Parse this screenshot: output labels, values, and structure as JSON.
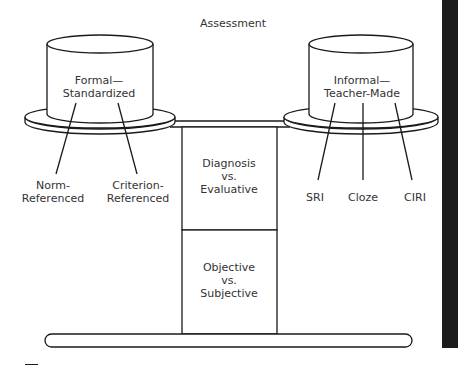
{
  "title": "Assessment",
  "left_pan": {
    "label_line1": "Formal—",
    "label_line2": "Standardized",
    "branches": [
      {
        "line1": "Norm-",
        "line2": "Referenced"
      },
      {
        "line1": "Criterion-",
        "line2": "Referenced"
      }
    ]
  },
  "right_pan": {
    "label_line1": "Informal—",
    "label_line2": "Teacher-Made",
    "branches": [
      {
        "label": "SRI"
      },
      {
        "label": "Cloze"
      },
      {
        "label": "CIRI"
      }
    ]
  },
  "column": {
    "top_box": {
      "line1": "Diagnosis",
      "line2": "vs.",
      "line3": "Evaluative"
    },
    "bottom_box": {
      "line1": "Objective",
      "line2": "vs.",
      "line3": "Subjective"
    }
  },
  "colors": {
    "line": "#1a1a1a",
    "text": "#333333",
    "edge_bar": "#1c1c1c",
    "background": "#ffffff"
  }
}
